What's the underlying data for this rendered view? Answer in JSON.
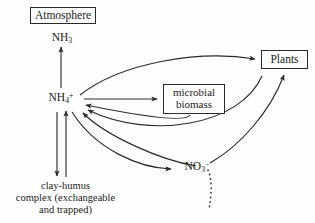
{
  "figure": {
    "background_color": "#fefefe",
    "stroke_color": "#2a2a2a",
    "text_color": "#1a1a1a"
  },
  "nodes": {
    "atmosphere": {
      "label": "Atmosphere",
      "shape": "box",
      "x": 30,
      "y": 7,
      "w": 66,
      "h": 17
    },
    "ammonia": {
      "label": "NH3",
      "label_base": "NH",
      "label_sub": "3",
      "shape": "text",
      "x": 62,
      "y": 38
    },
    "ammonium": {
      "label": "NH4+",
      "label_base": "NH",
      "label_sub": "4",
      "label_sup": "+",
      "shape": "text",
      "x": 61,
      "y": 98
    },
    "microbial_biomass": {
      "label": "microbial biomass",
      "line1": "microbial",
      "line2": "biomass",
      "shape": "box",
      "x": 163,
      "y": 84,
      "w": 62,
      "h": 30
    },
    "plants": {
      "label": "Plants",
      "shape": "box",
      "x": 261,
      "y": 50,
      "w": 47,
      "h": 19
    },
    "nitrate": {
      "label": "NO3-",
      "label_base": "NO",
      "label_sub": "3",
      "label_sup": "−",
      "shape": "text",
      "x": 197,
      "y": 167
    },
    "clay_humus": {
      "label": "clay-humus complex (exchangeable and trapped)",
      "line1": "clay-humus",
      "line2": "complex (exchangeable",
      "line3": "and trapped)",
      "shape": "text",
      "x": 65,
      "y": 196
    }
  },
  "edges": [
    {
      "id": "ammonium-to-ammonia",
      "from": "ammonium",
      "to": "ammonia",
      "style": "solid",
      "arrow": "single",
      "curve": "straight"
    },
    {
      "id": "clayhumus-to-ammonium",
      "from": "clay_humus",
      "to": "ammonium",
      "style": "solid",
      "arrow": "single",
      "curve": "straight"
    },
    {
      "id": "ammonium-to-clayhumus",
      "from": "ammonium",
      "to": "clay_humus",
      "style": "solid",
      "arrow": "single",
      "curve": "straight"
    },
    {
      "id": "ammonium-to-plants",
      "from": "ammonium",
      "to": "plants",
      "style": "solid",
      "arrow": "single",
      "curve": "arc-up"
    },
    {
      "id": "ammonium-to-microbial",
      "from": "ammonium",
      "to": "microbial_biomass",
      "style": "solid",
      "arrow": "single",
      "curve": "straight"
    },
    {
      "id": "microbial-to-ammonium",
      "from": "microbial_biomass",
      "to": "ammonium",
      "style": "solid",
      "arrow": "single",
      "curve": "arc-down"
    },
    {
      "id": "plants-to-ammonium",
      "from": "plants",
      "to": "ammonium",
      "style": "solid",
      "arrow": "single",
      "curve": "arc-down"
    },
    {
      "id": "nitrate-to-ammonium",
      "from": "nitrate",
      "to": "ammonium",
      "style": "solid",
      "arrow": "single",
      "curve": "arc-down"
    },
    {
      "id": "ammonium-to-nitrate",
      "from": "ammonium",
      "to": "nitrate",
      "style": "solid",
      "arrow": "single",
      "curve": "arc-down"
    },
    {
      "id": "nitrate-to-plants",
      "from": "nitrate",
      "to": "plants",
      "style": "solid",
      "arrow": "single",
      "curve": "arc-up"
    },
    {
      "id": "nitrate-leaching",
      "from": "nitrate",
      "to": "leaching",
      "style": "dotted",
      "arrow": "none",
      "curve": "arc-down"
    }
  ]
}
